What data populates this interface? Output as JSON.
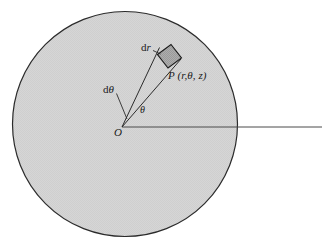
{
  "figure": {
    "background_color": "#ffffff",
    "disk": {
      "name": "shaded-disk",
      "fill_color": "#d4d4d4",
      "stroke_color": "#2b2b2b",
      "center_x": 125,
      "center_y": 124,
      "radius": 113
    },
    "axis_line": {
      "name": "polar-axis",
      "color": "#3a3a3a",
      "x1": 122,
      "y1": 127,
      "x2": 322,
      "y2": 127
    },
    "wedge": {
      "name": "angular-wedge",
      "stroke_color": "#2b2b2b",
      "apex_x": 122,
      "apex_y": 127,
      "ray_upper_x": 160,
      "ray_upper_y": 48,
      "ray_lower_x": 180,
      "ray_lower_y": 67
    },
    "area_element": {
      "name": "differential-area-element",
      "fill_color": "#a8a8a8",
      "stroke_color": "#1a1a1a",
      "points": "158,55 171,45 181,58 168,68"
    },
    "leaders": [
      {
        "name": "dr-leader-line",
        "x1": 154,
        "y1": 50,
        "x2": 161,
        "y2": 54
      },
      {
        "name": "dtheta-leader-line",
        "x1": 116,
        "y1": 95,
        "x2": 128,
        "y2": 120
      }
    ]
  },
  "labels": {
    "dr": "dr",
    "dr_upright": "d",
    "dr_italic": "r",
    "dtheta_upright": "d",
    "dtheta_italic": "θ",
    "theta": "θ",
    "origin": "O",
    "point_symbol": "P",
    "point_coords": "(r,θ, z)",
    "point_full": "P (r,θ, z)"
  },
  "colors": {
    "disk_fill": "#d4d4d4",
    "element_fill": "#a8a8a8",
    "stroke": "#2b2b2b",
    "text": "#1a1a1a",
    "page_background": "#ffffff"
  }
}
